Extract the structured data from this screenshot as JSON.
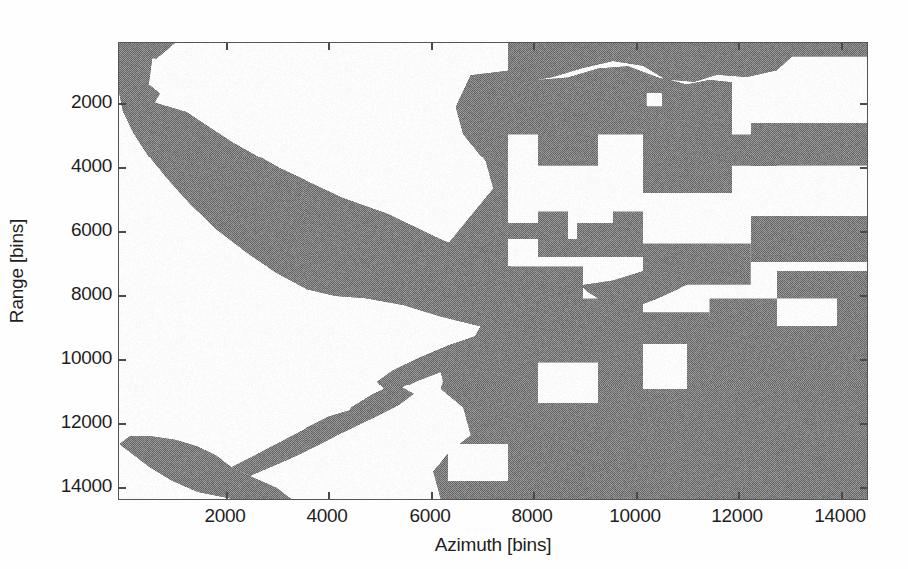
{
  "figure": {
    "background_color": "#ffffff",
    "axes_line_color": "#555555",
    "mask_fill_color": "#808080",
    "empty_fill_color": "#ffffff"
  },
  "chart_data": {
    "type": "heatmap",
    "title": "",
    "xlabel": "Azimuth [bins]",
    "ylabel": "Range [bins]",
    "xlim": [
      0,
      14600
    ],
    "ylim": [
      14800,
      300
    ],
    "y_axis_inverted": true,
    "grid": false,
    "legend": null,
    "xticks": [
      2000,
      4000,
      6000,
      8000,
      10000,
      12000,
      14000
    ],
    "xticklabels": [
      "2000",
      "4000",
      "6000",
      "8000",
      "10000",
      "12000",
      "14000"
    ],
    "yticks": [
      2000,
      4000,
      6000,
      8000,
      10000,
      12000,
      14000
    ],
    "yticklabels": [
      "2000",
      "4000",
      "6000",
      "8000",
      "10000",
      "12000",
      "14000"
    ],
    "value_levels": [
      {
        "label": "masked",
        "color": "#808080"
      },
      {
        "label": "unmasked",
        "color": "#ffffff"
      }
    ],
    "mask_polygons": [
      {
        "name": "upper-left-diagonal-band",
        "points": [
          [
            0,
            0
          ],
          [
            0.1,
            0
          ],
          [
            0.075,
            0.11
          ],
          [
            0.1,
            0.135
          ],
          [
            0.155,
            0.175
          ],
          [
            0.26,
            0.27
          ],
          [
            0.36,
            0.35
          ],
          [
            0.44,
            0.4
          ],
          [
            0.5,
            0.455
          ],
          [
            0.545,
            0.49
          ],
          [
            0.58,
            0.515
          ],
          [
            0.6,
            0.56
          ],
          [
            0.575,
            0.61
          ],
          [
            0.52,
            0.655
          ],
          [
            0.45,
            0.695
          ],
          [
            0.38,
            0.715
          ],
          [
            0.3,
            0.7
          ],
          [
            0.22,
            0.64
          ],
          [
            0.15,
            0.55
          ],
          [
            0.085,
            0.44
          ],
          [
            0.03,
            0.33
          ],
          [
            0.0,
            0.245
          ]
        ]
      },
      {
        "name": "lower-left-diagonal-band",
        "points": [
          [
            0.16,
            1.0
          ],
          [
            0.02,
            0.92
          ],
          [
            0.0,
            0.88
          ],
          [
            0.0,
            0.97
          ],
          [
            0.03,
            1.0
          ]
        ]
      },
      {
        "name": "right-blocky-region",
        "points": [
          [
            0.62,
            0.0
          ],
          [
            1.0,
            0.0
          ],
          [
            1.0,
            1.0
          ],
          [
            0.52,
            1.0
          ],
          [
            0.52,
            0.8
          ],
          [
            0.58,
            0.66
          ],
          [
            0.6,
            0.5
          ],
          [
            0.56,
            0.33
          ],
          [
            0.6,
            0.14
          ]
        ]
      }
    ]
  },
  "axes": {
    "x_title": "Azimuth [bins]",
    "y_title": "Range [bins]"
  }
}
